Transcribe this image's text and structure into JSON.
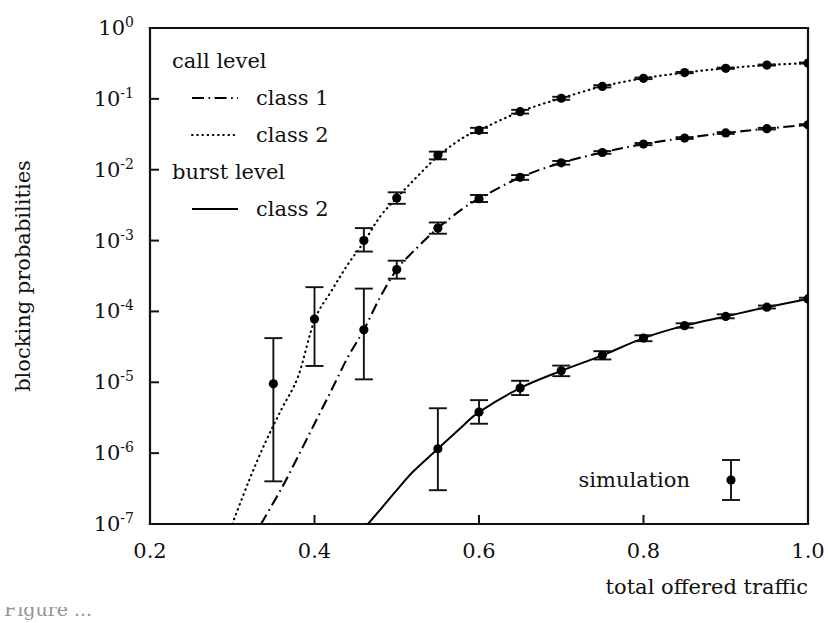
{
  "figure": {
    "background": "#ffffff",
    "ink_color": "#000000"
  },
  "axes": {
    "x": {
      "label": "total offered traffic",
      "ticks": [
        "0.2",
        "0.4",
        "0.6",
        "0.8",
        "1.0"
      ],
      "tick_values": [
        0.2,
        0.4,
        0.6,
        0.8,
        1.0
      ],
      "min": 0.2,
      "max": 1.0
    },
    "y": {
      "label": "blocking probabilities",
      "ticks": [
        "10^0",
        "10^-1",
        "10^-2",
        "10^-3",
        "10^-4",
        "10^-5",
        "10^-6",
        "10^-7"
      ],
      "tick_mantissa": "10",
      "tick_exponents": [
        "0",
        "-1",
        "-2",
        "-3",
        "-4",
        "-5",
        "-6",
        "-7"
      ],
      "min_exp": -7,
      "max_exp": 0,
      "scale": "log"
    }
  },
  "legend": {
    "groups": [
      {
        "heading": "call level",
        "entries": [
          {
            "label": "class 1",
            "style": "dashdot"
          },
          {
            "label": "class 2",
            "style": "dotted"
          }
        ]
      },
      {
        "heading": "burst level",
        "entries": [
          {
            "label": "class 2",
            "style": "solid"
          }
        ]
      }
    ],
    "marker_key": {
      "label": "simulation",
      "style": "errorbar-dot"
    }
  },
  "caption": "Figure ...",
  "chart_data": {
    "type": "line",
    "title": "",
    "xlabel": "total offered traffic",
    "ylabel": "blocking probabilities",
    "xlim": [
      0.2,
      1.0
    ],
    "ylim": [
      1e-07,
      1.0
    ],
    "yscale": "log",
    "grid": false,
    "legend_position": "top-left",
    "series": [
      {
        "name": "call level class 2",
        "style": "dotted",
        "curve_x": [
          0.3,
          0.32,
          0.34,
          0.36,
          0.38,
          0.4,
          0.42,
          0.44,
          0.46,
          0.48,
          0.5,
          0.52,
          0.55,
          0.58,
          0.6,
          0.65,
          0.7,
          0.75,
          0.8,
          0.85,
          0.9,
          0.95,
          1.0
        ],
        "curve_y": [
          1e-07,
          4e-07,
          1.4e-06,
          4.2e-06,
          1.2e-05,
          7.5e-05,
          0.00019,
          0.00045,
          0.00095,
          0.0022,
          0.004,
          0.007,
          0.0155,
          0.028,
          0.036,
          0.066,
          0.102,
          0.15,
          0.195,
          0.235,
          0.27,
          0.3,
          0.32
        ],
        "points_x": [
          0.35,
          0.4,
          0.46,
          0.5,
          0.55,
          0.6,
          0.65,
          0.7,
          0.75,
          0.8,
          0.85,
          0.9,
          0.95,
          1.0
        ],
        "points_y": [
          9.5e-06,
          7.8e-05,
          0.001,
          0.004,
          0.016,
          0.036,
          0.066,
          0.102,
          0.15,
          0.195,
          0.235,
          0.27,
          0.3,
          0.32
        ],
        "err_lo": [
          4e-07,
          1.7e-05,
          0.0007,
          0.0033,
          0.014,
          0.033,
          0.062,
          0.097,
          0.145,
          0.19,
          0.23,
          0.265,
          0.295,
          0.315
        ],
        "err_hi": [
          4.2e-05,
          0.00022,
          0.0015,
          0.0048,
          0.018,
          0.039,
          0.07,
          0.107,
          0.156,
          0.2,
          0.24,
          0.276,
          0.305,
          0.326
        ]
      },
      {
        "name": "call level class 1",
        "style": "dashdot",
        "curve_x": [
          0.335,
          0.36,
          0.38,
          0.4,
          0.42,
          0.44,
          0.46,
          0.48,
          0.5,
          0.52,
          0.55,
          0.58,
          0.6,
          0.65,
          0.7,
          0.75,
          0.8,
          0.85,
          0.9,
          0.95,
          1.0
        ],
        "curve_y": [
          1e-07,
          3.2e-07,
          9e-07,
          2.6e-06,
          7.5e-06,
          2.2e-05,
          5.5e-05,
          0.00016,
          0.00039,
          0.0007,
          0.0015,
          0.0028,
          0.0039,
          0.0078,
          0.0125,
          0.0175,
          0.023,
          0.028,
          0.033,
          0.038,
          0.043
        ],
        "points_x": [
          0.46,
          0.5,
          0.55,
          0.6,
          0.65,
          0.7,
          0.75,
          0.8,
          0.85,
          0.9,
          0.95,
          1.0
        ],
        "points_y": [
          5.5e-05,
          0.00039,
          0.0015,
          0.0039,
          0.0078,
          0.0125,
          0.0175,
          0.023,
          0.028,
          0.033,
          0.038,
          0.043
        ],
        "err_lo": [
          1.1e-05,
          0.00029,
          0.00125,
          0.0035,
          0.0072,
          0.0118,
          0.0168,
          0.0222,
          0.0272,
          0.032,
          0.037,
          0.042
        ],
        "err_hi": [
          0.00021,
          0.00052,
          0.0018,
          0.0044,
          0.0084,
          0.0133,
          0.0183,
          0.0238,
          0.0288,
          0.034,
          0.039,
          0.044
        ]
      },
      {
        "name": "burst level class 2",
        "style": "solid",
        "curve_x": [
          0.465,
          0.48,
          0.5,
          0.52,
          0.55,
          0.58,
          0.6,
          0.65,
          0.7,
          0.75,
          0.8,
          0.85,
          0.9,
          0.95,
          1.0
        ],
        "curve_y": [
          1e-07,
          1.6e-07,
          3e-07,
          5.5e-07,
          1.15e-06,
          2.4e-06,
          3.8e-06,
          8.3e-06,
          1.45e-05,
          2.4e-05,
          4.2e-05,
          6.3e-05,
          8.5e-05,
          0.000115,
          0.00015
        ],
        "points_x": [
          0.55,
          0.6,
          0.65,
          0.7,
          0.75,
          0.8,
          0.85,
          0.9,
          0.95,
          1.0
        ],
        "points_y": [
          1.15e-06,
          3.8e-06,
          8.3e-06,
          1.45e-05,
          2.4e-05,
          4.2e-05,
          6.3e-05,
          8.5e-05,
          0.000115,
          0.00015
        ],
        "err_lo": [
          3e-07,
          2.6e-06,
          6.6e-06,
          1.22e-05,
          2.1e-05,
          3.8e-05,
          5.9e-05,
          8e-05,
          0.00011,
          0.000145
        ],
        "err_hi": [
          4.3e-06,
          5.6e-06,
          1.05e-05,
          1.72e-05,
          2.75e-05,
          4.6e-05,
          6.8e-05,
          9.1e-05,
          0.000121,
          0.000156
        ]
      }
    ]
  }
}
